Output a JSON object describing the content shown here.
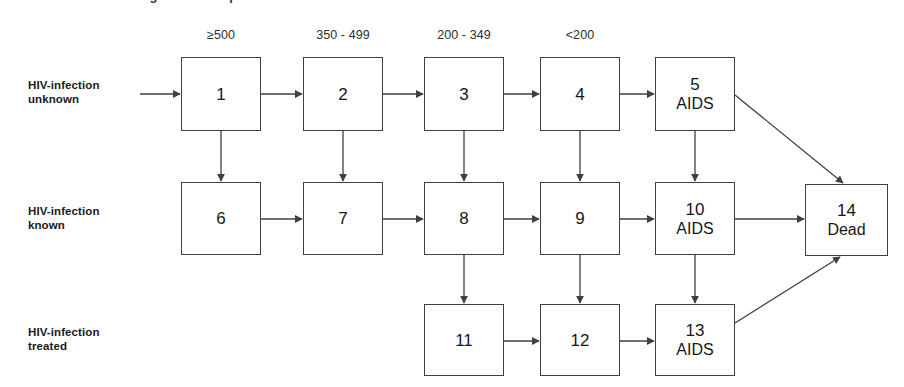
{
  "figure": {
    "clipped_title_fragment": "length of time spent in a treatment",
    "column_headers": [
      {
        "label": "≥500",
        "x": 221
      },
      {
        "label": "350 - 499",
        "x": 343
      },
      {
        "label": "200 - 349",
        "x": 464
      },
      {
        "label": "<200",
        "x": 580
      }
    ],
    "row_labels": [
      {
        "line1": "HIV-infection",
        "line2": "unknown",
        "x": 28,
        "y": 78
      },
      {
        "line1": "HIV-infection",
        "line2": "known",
        "x": 28,
        "y": 204
      },
      {
        "line1": "HIV-infection",
        "line2": "treated",
        "x": 28,
        "y": 325
      }
    ],
    "nodes": [
      {
        "id": "1",
        "sub": "",
        "x": 181,
        "y": 57,
        "w": 80,
        "h": 74
      },
      {
        "id": "2",
        "sub": "",
        "x": 303,
        "y": 57,
        "w": 80,
        "h": 74
      },
      {
        "id": "3",
        "sub": "",
        "x": 424,
        "y": 57,
        "w": 80,
        "h": 74
      },
      {
        "id": "4",
        "sub": "",
        "x": 540,
        "y": 57,
        "w": 80,
        "h": 74
      },
      {
        "id": "5",
        "sub": "AIDS",
        "x": 655,
        "y": 57,
        "w": 80,
        "h": 74
      },
      {
        "id": "6",
        "sub": "",
        "x": 181,
        "y": 182,
        "w": 80,
        "h": 73
      },
      {
        "id": "7",
        "sub": "",
        "x": 303,
        "y": 182,
        "w": 80,
        "h": 73
      },
      {
        "id": "8",
        "sub": "",
        "x": 424,
        "y": 182,
        "w": 80,
        "h": 73
      },
      {
        "id": "9",
        "sub": "",
        "x": 540,
        "y": 182,
        "w": 80,
        "h": 73
      },
      {
        "id": "10",
        "sub": "AIDS",
        "x": 655,
        "y": 182,
        "w": 80,
        "h": 73
      },
      {
        "id": "14",
        "sub": "Dead",
        "x": 805,
        "y": 184,
        "w": 83,
        "h": 72
      },
      {
        "id": "11",
        "sub": "",
        "x": 424,
        "y": 304,
        "w": 80,
        "h": 72
      },
      {
        "id": "12",
        "sub": "",
        "x": 540,
        "y": 304,
        "w": 80,
        "h": 72
      },
      {
        "id": "13",
        "sub": "AIDS",
        "x": 655,
        "y": 304,
        "w": 80,
        "h": 72
      }
    ],
    "edges": [
      {
        "from": "entry",
        "to": "1",
        "type": "horizontal"
      },
      {
        "from": "1",
        "to": "2",
        "type": "horizontal"
      },
      {
        "from": "2",
        "to": "3",
        "type": "horizontal"
      },
      {
        "from": "3",
        "to": "4",
        "type": "horizontal"
      },
      {
        "from": "4",
        "to": "5",
        "type": "horizontal"
      },
      {
        "from": "6",
        "to": "7",
        "type": "horizontal"
      },
      {
        "from": "7",
        "to": "8",
        "type": "horizontal"
      },
      {
        "from": "8",
        "to": "9",
        "type": "horizontal"
      },
      {
        "from": "9",
        "to": "10",
        "type": "horizontal"
      },
      {
        "from": "10",
        "to": "14",
        "type": "horizontal"
      },
      {
        "from": "11",
        "to": "12",
        "type": "horizontal"
      },
      {
        "from": "12",
        "to": "13",
        "type": "horizontal"
      },
      {
        "from": "1",
        "to": "6",
        "type": "vertical"
      },
      {
        "from": "2",
        "to": "7",
        "type": "vertical"
      },
      {
        "from": "3",
        "to": "8",
        "type": "vertical"
      },
      {
        "from": "4",
        "to": "9",
        "type": "vertical"
      },
      {
        "from": "5",
        "to": "10",
        "type": "vertical"
      },
      {
        "from": "8",
        "to": "11",
        "type": "vertical"
      },
      {
        "from": "9",
        "to": "12",
        "type": "vertical"
      },
      {
        "from": "10",
        "to": "13",
        "type": "vertical"
      },
      {
        "from": "5",
        "to": "14",
        "type": "diagonal"
      },
      {
        "from": "13",
        "to": "14",
        "type": "diagonal"
      }
    ],
    "colors": {
      "stroke": "#3f3f3f",
      "text": "#171717",
      "background": "#ffffff"
    }
  }
}
